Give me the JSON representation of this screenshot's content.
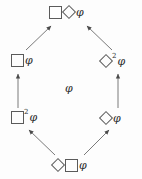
{
  "diagram": {
    "type": "hasse-diagram",
    "background_color": "#fdfdfd",
    "stroke_color": "#5a5a5a",
    "text_color": "#2b2b2b",
    "phi_symbol": "φ",
    "nodes": [
      {
        "id": "top",
        "label": "□◇φ",
        "operators": [
          "box",
          "diamond"
        ],
        "exponents": [
          "",
          ""
        ],
        "formula_text": "φ"
      },
      {
        "id": "upper-left",
        "label": "□φ",
        "operators": [
          "box"
        ],
        "exponents": [
          ""
        ],
        "formula_text": "φ"
      },
      {
        "id": "upper-right",
        "label": "◇²φ",
        "operators": [
          "diamond"
        ],
        "exponents": [
          "2"
        ],
        "formula_text": "φ"
      },
      {
        "id": "lower-left",
        "label": "□²φ",
        "operators": [
          "box"
        ],
        "exponents": [
          "2"
        ],
        "formula_text": "φ"
      },
      {
        "id": "lower-right",
        "label": "◇φ",
        "operators": [
          "diamond"
        ],
        "exponents": [
          ""
        ],
        "formula_text": "φ"
      },
      {
        "id": "bottom",
        "label": "◇□φ",
        "operators": [
          "diamond",
          "box"
        ],
        "exponents": [
          "",
          ""
        ],
        "formula_text": "φ"
      },
      {
        "id": "center",
        "label": "φ",
        "operators": [],
        "exponents": [],
        "formula_text": "φ"
      }
    ],
    "edges": [
      {
        "from": "upper-left",
        "to": "top",
        "style": "arrow",
        "direction": "up-right"
      },
      {
        "from": "upper-right",
        "to": "top",
        "style": "arrow",
        "direction": "up-left"
      },
      {
        "from": "lower-left",
        "to": "upper-left",
        "style": "arrow",
        "direction": "up"
      },
      {
        "from": "lower-right",
        "to": "upper-right",
        "style": "arrow",
        "direction": "up"
      },
      {
        "from": "bottom",
        "to": "lower-left",
        "style": "arrow",
        "direction": "up-left"
      },
      {
        "from": "bottom",
        "to": "lower-right",
        "style": "arrow",
        "direction": "up-right"
      }
    ],
    "exponent_two": "2"
  }
}
